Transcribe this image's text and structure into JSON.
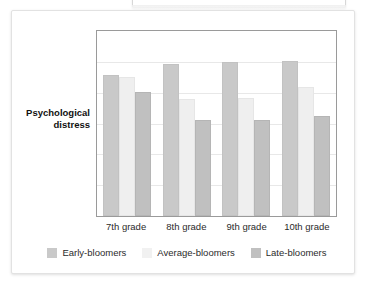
{
  "card": {
    "y_axis_title_line1": "Psychological",
    "y_axis_title_line2": "distress"
  },
  "chart_data": {
    "type": "bar",
    "title": "",
    "subtitle": "",
    "xlabel": "",
    "ylabel": "Psychological distress",
    "categories": [
      "7th grade",
      "8th grade",
      "9th grade",
      "10th grade"
    ],
    "series": [
      {
        "name": "Early-bloomers",
        "color": "#c9c9c9",
        "values": [
          76,
          82,
          83,
          84
        ]
      },
      {
        "name": "Average-bloomers",
        "color": "#efefef",
        "values": [
          75,
          63,
          64,
          70
        ]
      },
      {
        "name": "Late-bloomers",
        "color": "#c0c0c0",
        "values": [
          67,
          52,
          52,
          54
        ]
      }
    ],
    "ylim": [
      0,
      100
    ],
    "y_tick_labels": [],
    "gridlines": 5,
    "grid": true,
    "legend_position": "bottom",
    "annotations": []
  },
  "legend": {
    "items": [
      {
        "label": "Early-bloomers",
        "swatch": "early"
      },
      {
        "label": "Average-bloomers",
        "swatch": "average"
      },
      {
        "label": "Late-bloomers",
        "swatch": "late"
      }
    ]
  }
}
